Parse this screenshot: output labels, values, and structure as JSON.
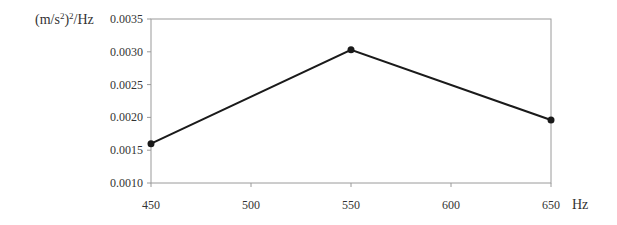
{
  "chart_data": {
    "type": "line",
    "title": "",
    "xlabel": "Hz",
    "ylabel": "(m/s²)²/Hz",
    "ylabel_parts": {
      "base": "(m/s",
      "sup1": "2",
      "mid": ")",
      "sup2": "2",
      "tail": "/Hz"
    },
    "x": [
      450,
      550,
      650
    ],
    "series": [
      {
        "name": "PSD",
        "values": [
          0.0016,
          0.00303,
          0.00196
        ],
        "color": "#1a1a1a"
      }
    ],
    "xlim": [
      450,
      650
    ],
    "ylim": [
      0.001,
      0.0035
    ],
    "x_ticks": [
      "450",
      "500",
      "550",
      "600",
      "650"
    ],
    "y_ticks": [
      "0.0010",
      "0.0015",
      "0.0020",
      "0.0025",
      "0.0030",
      "0.0035"
    ],
    "grid": false,
    "legend": null,
    "markers": "filled-circle"
  }
}
